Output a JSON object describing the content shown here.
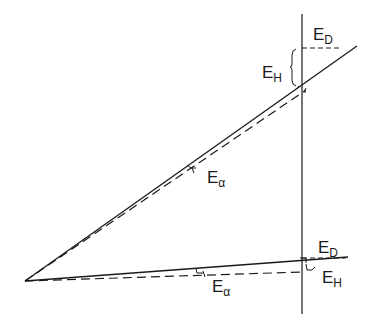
{
  "diagram": {
    "labels": {
      "upper_ED": {
        "main": "E",
        "sub": "D"
      },
      "upper_EH": {
        "main": "E",
        "sub": "H"
      },
      "upper_Ealpha": {
        "main": "E",
        "sub": "α"
      },
      "lower_ED": {
        "main": "E",
        "sub": "D"
      },
      "lower_EH": {
        "main": "E",
        "sub": "H"
      },
      "lower_Ealpha": {
        "main": "E",
        "sub": "α"
      }
    },
    "colors": {
      "stroke": "#1a1a1a",
      "background": "#ffffff"
    }
  }
}
